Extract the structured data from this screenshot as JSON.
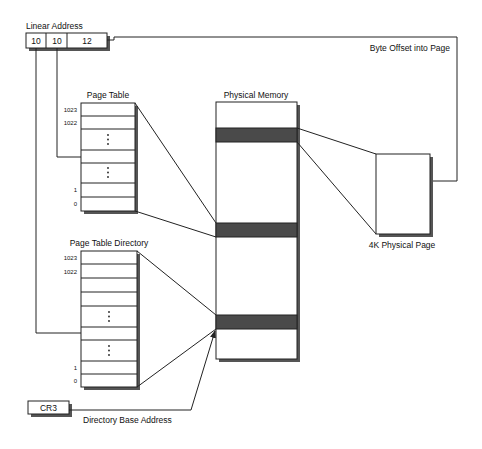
{
  "diagram": {
    "linear_address": {
      "title": "Linear Address",
      "fields": [
        "10",
        "10",
        "12"
      ]
    },
    "page_table": {
      "title": "Page Table",
      "index_labels": {
        "top1": "1023",
        "top2": "1022",
        "bottom1": "1",
        "bottom0": "0"
      },
      "ellipsis": "⋮"
    },
    "page_table_directory": {
      "title": "Page Table Directory",
      "index_labels": {
        "top1": "1023",
        "top2": "1022",
        "bottom1": "1",
        "bottom0": "0"
      },
      "ellipsis": "⋮"
    },
    "physical_memory": {
      "title": "Physical Memory",
      "highlighted_frames": 3
    },
    "physical_page": {
      "title": "4K Physical Page"
    },
    "cr3": {
      "label": "CR3",
      "caption": "Directory Base Address"
    },
    "byte_offset": {
      "caption": "Byte Offset into Page"
    },
    "colors": {
      "line": "#222222",
      "frame_fill": "#4a4a4a",
      "shadow": "#555555",
      "background": "#ffffff"
    }
  }
}
